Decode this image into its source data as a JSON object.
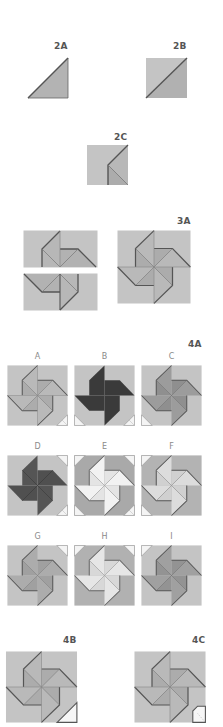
{
  "colors": {
    "background": "#ffffff",
    "base_square": "#c4c4c4",
    "light_gray": "#bdbdbd",
    "mid_gray": "#a9a9a9",
    "dark_gray": "#8f8f8f",
    "black": "#3a3a3a",
    "white_blade": "#ececec",
    "edge": "#666666",
    "label_text": "#555555",
    "sublabel_text": "#8a8a8a"
  },
  "steps": {
    "s2a": {
      "label": "2A",
      "description": "half-square triangle"
    },
    "s2b": {
      "label": "2B",
      "description": "square divided on diagonal"
    },
    "s2c": {
      "label": "2C",
      "description": "square with folded corner"
    },
    "s3a": {
      "label": "3A",
      "description": "two rectangles joined into pinwheel block"
    },
    "s4a": {
      "label": "4A",
      "variants": [
        {
          "letter": "A",
          "shade": "standard"
        },
        {
          "letter": "B",
          "shade": "black"
        },
        {
          "letter": "C",
          "shade": "dark"
        },
        {
          "letter": "D",
          "shade": "dark-black"
        },
        {
          "letter": "E",
          "shade": "white"
        },
        {
          "letter": "F",
          "shade": "light"
        },
        {
          "letter": "G",
          "shade": "mid"
        },
        {
          "letter": "H",
          "shade": "white-light"
        },
        {
          "letter": "I",
          "shade": "mid-dark"
        }
      ]
    },
    "s4b": {
      "label": "4B",
      "description": "pinwheel block with one white corner"
    },
    "s4c": {
      "label": "4C",
      "description": "pinwheel block with notched white corner"
    }
  }
}
